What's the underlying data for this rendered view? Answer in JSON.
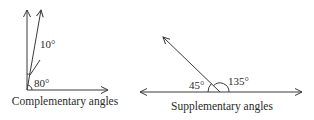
{
  "diagrams": [
    {
      "caption": "Complementary angles",
      "angles": [
        {
          "label": "10°",
          "value": 10
        },
        {
          "label": "80°",
          "value": 80
        }
      ]
    },
    {
      "caption": "Supplementary angles",
      "angles": [
        {
          "label": "45°",
          "value": 45
        },
        {
          "label": "135°",
          "value": 135
        }
      ]
    }
  ],
  "colors": {
    "line": "#3a3a3a",
    "text": "#2a2a2a",
    "background": "#ffffff"
  }
}
